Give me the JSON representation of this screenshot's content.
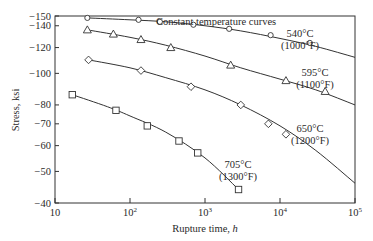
{
  "chart_data": {
    "type": "line",
    "title": "",
    "xlabel": "Rupture time, h",
    "ylabel": "Stress, ksi",
    "x_scale": "log",
    "y_scale": "log",
    "xlim": [
      10,
      100000
    ],
    "ylim": [
      40,
      150
    ],
    "x_ticks": [
      10,
      100,
      1000,
      10000,
      100000
    ],
    "x_tick_labels": [
      "10",
      "10^2",
      "10^3",
      "10^4",
      "10^5"
    ],
    "y_ticks": [
      150,
      140,
      120,
      100,
      80,
      70,
      60,
      50,
      40
    ],
    "y_tick_labels": [
      "150",
      "140",
      "120",
      "100",
      "80",
      "70",
      "60",
      "50",
      "40"
    ],
    "grid": false,
    "annotation": "Constant temperature curves",
    "series": [
      {
        "name": "540°C (1000°F)",
        "label_line1": "540°C",
        "label_line2": "(1000°F)",
        "marker": "circle",
        "points": [
          [
            27,
            148
          ],
          [
            130,
            146
          ],
          [
            250,
            144
          ],
          [
            700,
            141
          ],
          [
            2100,
            137
          ],
          [
            7500,
            131
          ],
          [
            25000,
            124
          ]
        ],
        "curve": [
          [
            27,
            148
          ],
          [
            100,
            146
          ],
          [
            300,
            144
          ],
          [
            1000,
            140
          ],
          [
            3000,
            135
          ],
          [
            10000,
            128
          ],
          [
            30000,
            121
          ],
          [
            100000,
            112
          ]
        ]
      },
      {
        "name": "595°C (1100°F)",
        "label_line1": "595°C",
        "label_line2": "(1100°F)",
        "marker": "triangle",
        "points": [
          [
            27,
            136
          ],
          [
            60,
            132
          ],
          [
            140,
            127
          ],
          [
            350,
            120
          ],
          [
            2200,
            106
          ],
          [
            12000,
            95
          ],
          [
            40000,
            88
          ]
        ],
        "curve": [
          [
            27,
            136
          ],
          [
            100,
            129
          ],
          [
            300,
            122
          ],
          [
            1000,
            113
          ],
          [
            3000,
            104
          ],
          [
            10000,
            96
          ],
          [
            30000,
            89
          ],
          [
            100000,
            80
          ]
        ]
      },
      {
        "name": "650°C (1200°F)",
        "label_line1": "650°C",
        "label_line2": "(1200°F)",
        "marker": "diamond",
        "points": [
          [
            28,
            110
          ],
          [
            140,
            102
          ],
          [
            650,
            91
          ],
          [
            3000,
            80
          ],
          [
            7000,
            70
          ],
          [
            12000,
            65
          ]
        ],
        "curve": [
          [
            28,
            110
          ],
          [
            100,
            104
          ],
          [
            300,
            97
          ],
          [
            1000,
            89
          ],
          [
            3000,
            80
          ],
          [
            10000,
            69
          ],
          [
            30000,
            58
          ],
          [
            100000,
            46
          ]
        ]
      },
      {
        "name": "705°C (1300°F)",
        "label_line1": "705°C",
        "label_line2": "(1300°F)",
        "marker": "square",
        "points": [
          [
            17,
            86
          ],
          [
            65,
            77
          ],
          [
            170,
            69
          ],
          [
            450,
            62
          ],
          [
            800,
            57
          ],
          [
            2800,
            44
          ]
        ],
        "curve": [
          [
            17,
            86
          ],
          [
            50,
            79
          ],
          [
            100,
            74
          ],
          [
            300,
            66
          ],
          [
            1000,
            55
          ],
          [
            2800,
            44
          ]
        ]
      }
    ]
  }
}
